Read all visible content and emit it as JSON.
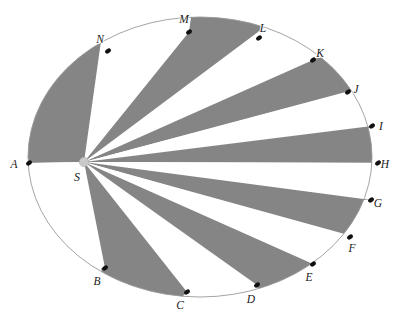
{
  "figure": {
    "background_color": "#ffffff",
    "shaded_color": "#858585",
    "unshaded_color": "#ffffff",
    "outline_color": "#9a9a9a",
    "marker_color": "#111111",
    "apex_marker_color": "#c9c9c9",
    "label_color": "#1a1a1a"
  },
  "chart_data": {
    "type": "scatter",
    "xlabel": "",
    "ylabel": "",
    "grid": false,
    "legend": null,
    "ellipse": {
      "center_x": 200,
      "center_y": 157,
      "radius_x": 172,
      "radius_y": 140
    },
    "apex": {
      "label": "S",
      "x": 84,
      "y": 162,
      "label_x": 77,
      "label_y": 181
    },
    "points": [
      {
        "label": "A",
        "x": 29,
        "y": 163,
        "label_x": 14,
        "label_y": 168
      },
      {
        "label": "B",
        "x": 105,
        "y": 268,
        "label_x": 97,
        "label_y": 285
      },
      {
        "label": "C",
        "x": 187,
        "y": 292,
        "label_x": 180,
        "label_y": 309
      },
      {
        "label": "D",
        "x": 257,
        "y": 285,
        "label_x": 251,
        "label_y": 303
      },
      {
        "label": "E",
        "x": 313,
        "y": 264,
        "label_x": 309,
        "label_y": 281
      },
      {
        "label": "F",
        "x": 350,
        "y": 237,
        "label_x": 352,
        "label_y": 252
      },
      {
        "label": "G",
        "x": 371,
        "y": 200,
        "label_x": 378,
        "label_y": 207
      },
      {
        "label": "H",
        "x": 378,
        "y": 163,
        "label_x": 385,
        "label_y": 168
      },
      {
        "label": "I",
        "x": 372,
        "y": 126,
        "label_x": 381,
        "label_y": 130
      },
      {
        "label": "J",
        "x": 348,
        "y": 92,
        "label_x": 356,
        "label_y": 93
      },
      {
        "label": "K",
        "x": 313,
        "y": 60,
        "label_x": 320,
        "label_y": 57
      },
      {
        "label": "L",
        "x": 259,
        "y": 38,
        "label_x": 263,
        "label_y": 32
      },
      {
        "label": "M",
        "x": 189,
        "y": 32,
        "label_x": 184,
        "label_y": 23
      },
      {
        "label": "N",
        "x": 108,
        "y": 51,
        "label_x": 100,
        "label_y": 43
      }
    ],
    "wedges": [
      {
        "from": "A",
        "to": "N",
        "shaded": true
      },
      {
        "from": "N",
        "to": "M",
        "shaded": false
      },
      {
        "from": "M",
        "to": "L",
        "shaded": true
      },
      {
        "from": "L",
        "to": "K",
        "shaded": false
      },
      {
        "from": "K",
        "to": "J",
        "shaded": true
      },
      {
        "from": "J",
        "to": "I",
        "shaded": false
      },
      {
        "from": "I",
        "to": "H",
        "shaded": true
      },
      {
        "from": "H",
        "to": "G",
        "shaded": false
      },
      {
        "from": "G",
        "to": "F",
        "shaded": true
      },
      {
        "from": "F",
        "to": "E",
        "shaded": false
      },
      {
        "from": "E",
        "to": "D",
        "shaded": true
      },
      {
        "from": "D",
        "to": "C",
        "shaded": false
      },
      {
        "from": "C",
        "to": "B",
        "shaded": true
      },
      {
        "from": "B",
        "to": "A",
        "shaded": false
      }
    ]
  }
}
